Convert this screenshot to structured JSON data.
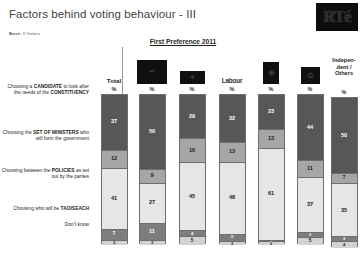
{
  "header": {
    "title": "Factors behind voting behaviour - III",
    "base_label": "Base:",
    "base_value": "ll Voters",
    "logo": "rte-logo",
    "logo_text": "RTé"
  },
  "chart_title": "First Preference 2011",
  "columns": [
    {
      "id": "total",
      "label": "Total",
      "type": "text",
      "pct": "%"
    },
    {
      "id": "fine-gael",
      "label": "",
      "type": "logo",
      "logo": "fine-gael-logo",
      "glyph": "✒",
      "pct": "%"
    },
    {
      "id": "fianna-fail",
      "label": "",
      "type": "logo",
      "logo": "fianna-fail-logo",
      "glyph": "✦",
      "pct": "%"
    },
    {
      "id": "labour",
      "label": "Labour",
      "type": "wordmark",
      "logo": "labour-logo",
      "pct": "%"
    },
    {
      "id": "sinn-fein",
      "label": "",
      "type": "logo",
      "logo": "sinn-fein-logo",
      "glyph": "◉",
      "pct": "%"
    },
    {
      "id": "green",
      "label": "",
      "type": "logo",
      "logo": "green-party-logo",
      "glyph": "✿",
      "pct": "%"
    },
    {
      "id": "independent",
      "label": "Independent / Others",
      "type": "text-multiline",
      "pct": "%"
    }
  ],
  "rows": [
    {
      "id": "candidate",
      "html": "Choosing a <b>CANDIDATE</b> to look after the needs of the <b>CONSTITUENCY</b>"
    },
    {
      "id": "ministers",
      "html": "Choosing the <b>SET OF MINISTERS</b> who will form the government"
    },
    {
      "id": "policies",
      "html": "Choosing between the <b>POLICIES</b> as set out by the parties"
    },
    {
      "id": "taoiseach",
      "html": "Choosing who will be <b>TAOISEACH</b>"
    },
    {
      "id": "dont-know",
      "html": "Don&rsquo;t know"
    }
  ],
  "chart_data": {
    "type": "bar",
    "subtype": "100% stacked column",
    "title": "Factors behind voting behaviour - III",
    "subtitle": "First Preference 2011",
    "xlabel": "",
    "ylabel": "%",
    "ylim": [
      0,
      100
    ],
    "grid": false,
    "legend_position": "in-bar data labels",
    "categories": [
      "Total",
      "Fine Gael",
      "Fianna Fáil",
      "Labour",
      "Sinn Féin",
      "Green",
      "Independent / Others"
    ],
    "series": [
      {
        "name": "Choosing a CANDIDATE to look after the needs of the CONSTITUENCY",
        "color": "#575757",
        "values": [
          37,
          50,
          29,
          32,
          23,
          44,
          50
        ]
      },
      {
        "name": "Choosing the SET OF MINISTERS who will form the government",
        "color": "#a6a6a6",
        "values": [
          12,
          9,
          16,
          13,
          13,
          11,
          7
        ]
      },
      {
        "name": "Choosing between the POLICIES as set out by the parties",
        "color": "#e6e6e6",
        "values": [
          41,
          27,
          45,
          48,
          61,
          37,
          35
        ]
      },
      {
        "name": "Choosing who will be TAOISEACH",
        "color": "#7d7d7d",
        "values": [
          7,
          11,
          4,
          5,
          1,
          3,
          3
        ]
      },
      {
        "name": "Don't know",
        "color": "#d2d2d2",
        "values": [
          3,
          3,
          5,
          2,
          2,
          5,
          4
        ]
      }
    ]
  }
}
